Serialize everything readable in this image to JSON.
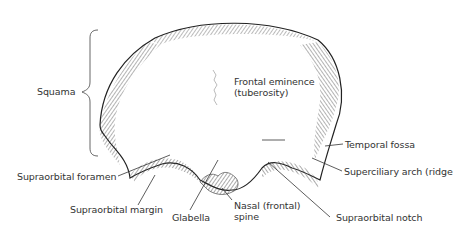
{
  "diagram": {
    "labels": {
      "squama": "Squama",
      "frontal_eminence_line1": "Frontal eminence",
      "frontal_eminence_line2": "(tuberosity)",
      "temporal_fossa": "Temporal fossa",
      "superciliary_arch": "Superciliary arch (ridge",
      "supraorbital_foramen": "Supraorbital foramen",
      "supraorbital_margin": "Supraorbital margin",
      "glabella": "Glabella",
      "nasal_spine_line1": "Nasal (frontal)",
      "nasal_spine_line2": "spine",
      "supraorbital_notch": "Supraorbital notch"
    },
    "colors": {
      "ink": "#222222",
      "leader": "#333333",
      "background": "#ffffff"
    }
  }
}
